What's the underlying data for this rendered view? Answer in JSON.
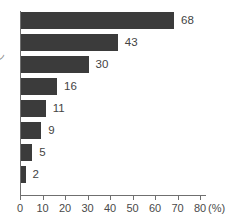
{
  "chart_data": {
    "type": "bar",
    "orientation": "horizontal",
    "title": "",
    "subtitle": "",
    "xlabel": "(%)",
    "ylabel": "",
    "categories": [
      "",
      "",
      "",
      "",
      "",
      "",
      "",
      ""
    ],
    "values": [
      68,
      43,
      30,
      16,
      11,
      9,
      5,
      2
    ],
    "data_labels": [
      "68",
      "43",
      "30",
      "16",
      "11",
      "9",
      "5",
      "2"
    ],
    "series": [
      {
        "name": "",
        "values": [
          68,
          43,
          30,
          16,
          11,
          9,
          5,
          2
        ]
      }
    ],
    "xlim": [
      0,
      80
    ],
    "ylim": [
      0,
      8
    ],
    "x_ticks": [
      0,
      10,
      20,
      30,
      40,
      50,
      60,
      70,
      80
    ],
    "x_tick_labels": [
      "0",
      "10",
      "20",
      "30",
      "40",
      "50",
      "60",
      "70",
      "80"
    ],
    "unit": "(%)",
    "grid": false,
    "legend": false,
    "legend_position": "none",
    "bar_color": "#3b3b3b",
    "axis_color": "#6f6f6f",
    "text_color": "#434343",
    "background_color": "#ffffff"
  },
  "axis": {
    "unit_label": "(%)",
    "tick_labels": [
      "0",
      "10",
      "20",
      "30",
      "40",
      "50",
      "60",
      "70",
      "80"
    ]
  },
  "annotations": {
    "clipped_left_label": "ン"
  }
}
